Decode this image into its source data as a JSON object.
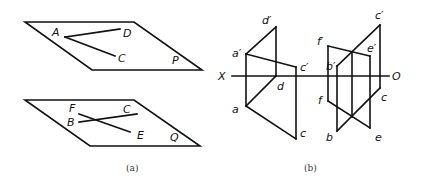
{
  "figure_a": {
    "caption": "(a)",
    "plane_p": {
      "label": "P",
      "points": {
        "A": "A",
        "D": "D",
        "C": "C"
      }
    },
    "plane_q": {
      "label": "Q",
      "points": {
        "F": "F",
        "B": "B",
        "C": "C",
        "E": "E"
      }
    }
  },
  "figure_b": {
    "caption": "(b)",
    "axis": {
      "start": "X",
      "end": "O"
    },
    "left": {
      "upper": {
        "a": "a′",
        "d": "d′",
        "c": "c′"
      },
      "lower": {
        "a": "a",
        "d": "d",
        "c": "c"
      }
    },
    "right": {
      "upper": {
        "f": "f′",
        "b": "b′",
        "c": "c′",
        "e": "e′"
      },
      "lower": {
        "f": "f",
        "b": "b",
        "c": "c",
        "e": "e"
      }
    }
  }
}
